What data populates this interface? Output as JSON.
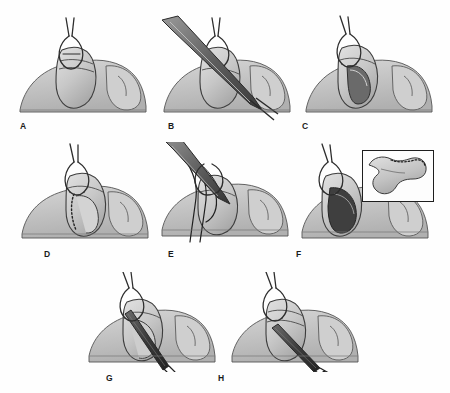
{
  "figure": {
    "background_color": "#fefefe",
    "ink_color": "#2b2b2b",
    "tissue_fill": "#c9c9c9",
    "tissue_fill_light": "#dcdcdc",
    "tissue_fill_dark": "#9a9a9a",
    "lumen_dark": "#4a4a4a",
    "instrument_fill": "#6f6f6f",
    "panel_count": 8
  },
  "panels": [
    {
      "id": "A",
      "label": "A",
      "label_x": 20,
      "label_y": 122,
      "x": 14,
      "y": 14,
      "width": 140,
      "height": 108,
      "caption_text": "Clamp applied to tubular structure, intact serosa",
      "elements": {
        "clamp": "ring-handled clamp grasping apex",
        "tissue": "lobulated soft tissue mass",
        "marking": "none"
      }
    },
    {
      "id": "B",
      "label": "B",
      "label_x": 168,
      "label_y": 122,
      "x": 158,
      "y": 14,
      "width": 140,
      "height": 108,
      "caption_text": "Scissors incise the structure longitudinally",
      "elements": {
        "clamp": "ring-handled clamp grasping apex",
        "tissue": "lobulated soft tissue mass",
        "instrument": "long straight scissors crossing from upper-left to lower-right",
        "marking": "none"
      }
    },
    {
      "id": "C",
      "label": "C",
      "label_x": 302,
      "label_y": 122,
      "x": 300,
      "y": 14,
      "width": 140,
      "height": 108,
      "caption_text": "Incision opened, exposing the lumen",
      "elements": {
        "clamp": "ring-handled clamp grasping apex",
        "tissue": "lobulated soft tissue mass",
        "lumen": "open dark slit visible",
        "marking": "none"
      }
    },
    {
      "id": "D",
      "label": "D",
      "label_x": 44,
      "label_y": 250,
      "x": 14,
      "y": 142,
      "width": 140,
      "height": 104,
      "caption_text": "Dotted line marks the planned line of excision",
      "elements": {
        "clamp": "ring-handled clamp grasping apex",
        "tissue": "lobulated soft tissue mass",
        "marking": "dotted resection line along opened edge"
      }
    },
    {
      "id": "E",
      "label": "E",
      "label_x": 168,
      "label_y": 250,
      "x": 158,
      "y": 142,
      "width": 140,
      "height": 104,
      "caption_text": "Sutures passed and held with instrument",
      "elements": {
        "clamp": "ring-handled clamp grasping apex",
        "tissue": "lobulated soft tissue mass",
        "instrument": "needle holder with curved suture strands looping through tissue",
        "sutures": "multiple dark suture threads"
      }
    },
    {
      "id": "F",
      "label": "F",
      "label_x": 296,
      "label_y": 250,
      "x": 300,
      "y": 142,
      "width": 140,
      "height": 104,
      "caption_text": "Defect open after excision; inset shows the resected specimen",
      "elements": {
        "clamp": "ring-handled clamp grasping apex",
        "tissue": "lobulated soft tissue mass",
        "lumen": "wide dark open defect",
        "inset": "excised crescentic specimen with dotted cut margin"
      },
      "inset": {
        "x": 362,
        "y": 150,
        "width": 72,
        "height": 52,
        "border_color": "#1e1e1e",
        "specimen_label": "excised-specimen"
      }
    },
    {
      "id": "G",
      "label": "G",
      "label_x": 106,
      "label_y": 378,
      "x": 85,
      "y": 272,
      "width": 140,
      "height": 100,
      "caption_text": "Dilator introduced through the opening",
      "elements": {
        "clamp": "ring-handled clamp grasping apex",
        "tissue": "lobulated soft tissue mass",
        "instrument": "dark tapered dilator passed obliquely into the lumen"
      }
    },
    {
      "id": "H",
      "label": "H",
      "label_x": 218,
      "label_y": 378,
      "x": 228,
      "y": 272,
      "width": 140,
      "height": 100,
      "caption_text": "Final position of the instrument within the closed structure",
      "elements": {
        "clamp": "ring-handled clamp grasping apex",
        "tissue": "lobulated soft tissue mass",
        "instrument": "dark tapered dilator seated in the closed structure"
      }
    }
  ]
}
